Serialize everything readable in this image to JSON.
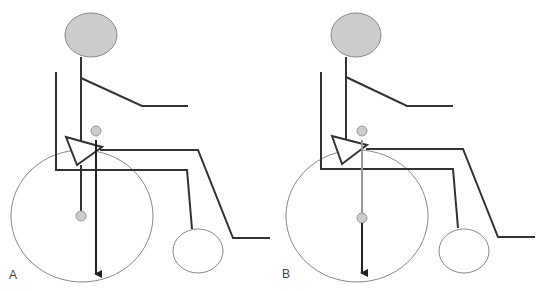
{
  "figure": {
    "panels": [
      {
        "label": "A",
        "description": "Seated figure in wheelchair; center-of-mass line falls from hip in front of rear wheel axle",
        "head": {
          "cx": 91,
          "cy": 35,
          "rx": 26,
          "ry": 22
        },
        "com_dot": {
          "cx": 96,
          "cy": 131
        },
        "axle_dot": {
          "cx": 81,
          "cy": 216
        },
        "rear_wheel": {
          "cx": 82,
          "cy": 216,
          "rx": 71,
          "ry": 66
        },
        "caster": {
          "cx": 198,
          "cy": 251,
          "rx": 25,
          "ry": 22
        }
      },
      {
        "label": "B",
        "description": "Seated figure in wheelchair; center-of-mass line passes through rear wheel axle",
        "head": {
          "cx": 356,
          "cy": 35,
          "rx": 25,
          "ry": 22
        },
        "com_dot": {
          "cx": 362,
          "cy": 131
        },
        "axle_dot": {
          "cx": 362,
          "cy": 218
        },
        "rear_wheel": {
          "cx": 357,
          "cy": 216,
          "rx": 71,
          "ry": 66
        },
        "caster": {
          "cx": 464,
          "cy": 251,
          "rx": 25,
          "ry": 22
        }
      }
    ],
    "colors": {
      "head_fill": "#cccccc",
      "dot_fill": "#cccccc",
      "line": "#333333",
      "wheel_stroke": "#888888",
      "com_line_gray": "#999999"
    }
  }
}
